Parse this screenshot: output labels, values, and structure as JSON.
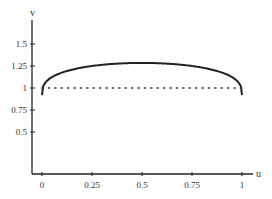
{
  "chart_data": {
    "type": "line",
    "title": "",
    "xlabel": "u",
    "ylabel": "v",
    "xlim": [
      0,
      1
    ],
    "ylim": [
      0,
      1.75
    ],
    "x_ticks": [
      "0",
      "0.25",
      "0.5",
      "0.75",
      "1"
    ],
    "y_ticks": [
      "0.5",
      "0.75",
      "1",
      "1.25",
      "1.5"
    ],
    "grid": false,
    "legend": null,
    "series": [
      {
        "name": "curve",
        "style": "solid",
        "x": [
          0,
          0.01,
          0.05,
          0.1,
          0.2,
          0.3,
          0.4,
          0.5,
          0.6,
          0.7,
          0.8,
          0.9,
          0.95,
          0.99,
          1
        ],
        "values": [
          0.92,
          1.0,
          1.09,
          1.15,
          1.22,
          1.26,
          1.28,
          1.285,
          1.28,
          1.26,
          1.22,
          1.15,
          1.09,
          1.0,
          0.92
        ]
      },
      {
        "name": "reference v=1",
        "style": "dotted",
        "x": [
          0,
          1
        ],
        "values": [
          1,
          1
        ]
      }
    ]
  }
}
